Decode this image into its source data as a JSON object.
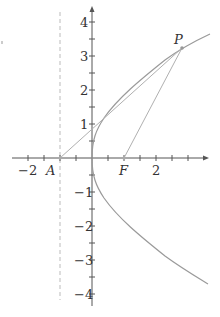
{
  "diagram": {
    "type": "parabola-focus-directrix",
    "equation": "y^2 = 4x",
    "points": {
      "A": {
        "label": "A",
        "x": -1,
        "y": 0
      },
      "F": {
        "label": "F",
        "x": 1,
        "y": 0
      },
      "P": {
        "label": "P",
        "x": 2.8,
        "y": 3.3
      }
    },
    "directrix": "x = -1",
    "x_axis": {
      "tick_labels": [
        {
          "value": -2,
          "text": "−2"
        },
        {
          "value": 2,
          "text": "2"
        }
      ],
      "range": [
        -2.5,
        3.6
      ]
    },
    "y_axis": {
      "tick_labels": [
        {
          "value": 4,
          "text": "4"
        },
        {
          "value": 3,
          "text": "3"
        },
        {
          "value": 2,
          "text": "2"
        },
        {
          "value": 1,
          "text": "1"
        },
        {
          "value": -1,
          "text": "−1"
        },
        {
          "value": -2,
          "text": "−2"
        },
        {
          "value": -3,
          "text": "−3"
        },
        {
          "value": -4,
          "text": "−4"
        }
      ],
      "range": [
        -4.3,
        4.4
      ]
    },
    "segments": [
      "A-P",
      "F-P"
    ],
    "colors": {
      "axis": "#555555",
      "curve": "#9a9a9a",
      "lines": "#b0b0b0",
      "dashed": "#bbbbbb",
      "text": "#333333"
    }
  }
}
